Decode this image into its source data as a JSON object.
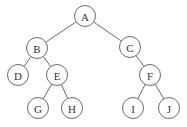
{
  "diagram": {
    "type": "binary-tree",
    "node_radius": 10.5,
    "stroke_color": "#5a5a5a",
    "text_color": "#333333",
    "background": "#ffffff",
    "nodes": [
      {
        "id": "A",
        "label": "A",
        "x": 85,
        "y": 16
      },
      {
        "id": "B",
        "label": "B",
        "x": 37,
        "y": 48
      },
      {
        "id": "C",
        "label": "C",
        "x": 130,
        "y": 47
      },
      {
        "id": "D",
        "label": "D",
        "x": 18,
        "y": 75
      },
      {
        "id": "E",
        "label": "E",
        "x": 57,
        "y": 75
      },
      {
        "id": "F",
        "label": "F",
        "x": 150,
        "y": 75
      },
      {
        "id": "G",
        "label": "G",
        "x": 38,
        "y": 108
      },
      {
        "id": "H",
        "label": "H",
        "x": 72,
        "y": 108
      },
      {
        "id": "I",
        "label": "I",
        "x": 133,
        "y": 108
      },
      {
        "id": "J",
        "label": "J",
        "x": 169,
        "y": 108
      }
    ],
    "edges": [
      {
        "from": "A",
        "to": "B"
      },
      {
        "from": "A",
        "to": "C"
      },
      {
        "from": "B",
        "to": "D"
      },
      {
        "from": "B",
        "to": "E"
      },
      {
        "from": "E",
        "to": "G"
      },
      {
        "from": "E",
        "to": "H"
      },
      {
        "from": "C",
        "to": "F"
      },
      {
        "from": "F",
        "to": "I"
      },
      {
        "from": "F",
        "to": "J"
      }
    ]
  }
}
